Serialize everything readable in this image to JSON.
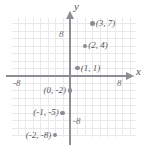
{
  "figure": {
    "type": "coordinate-plane",
    "axis_names": {
      "x": "x",
      "y": "y"
    },
    "ticks": {
      "y_positive": "8",
      "y_negative": "-8",
      "x_positive": "8",
      "x_negative": "-8"
    },
    "colors": {
      "axis": "#8d8d93",
      "grid": "#e9e9ec",
      "point": "#8b8b91",
      "text": "#55555b",
      "background": "#ffffff"
    }
  },
  "chart_data": {
    "type": "scatter",
    "title": "",
    "xlabel": "x",
    "ylabel": "y",
    "xlim": [
      -9,
      9
    ],
    "ylim": [
      -9,
      9
    ],
    "grid": true,
    "legend": "none",
    "xticks": [
      "-8",
      "8"
    ],
    "yticks": [
      "8",
      "-8"
    ],
    "points": [
      {
        "label": "(3, 7)",
        "x": 3,
        "y": 7,
        "label_side": "right"
      },
      {
        "label": "(2, 4)",
        "x": 2,
        "y": 4,
        "label_side": "right"
      },
      {
        "label": "(1, 1)",
        "x": 1,
        "y": 1,
        "label_side": "right"
      },
      {
        "label": "(0, -2)",
        "x": 0,
        "y": -2,
        "label_side": "left"
      },
      {
        "label": "(-1, -5)",
        "x": -1,
        "y": -5,
        "label_side": "left"
      },
      {
        "label": "(-2, -8)",
        "x": -2,
        "y": -8,
        "label_side": "left"
      }
    ]
  }
}
